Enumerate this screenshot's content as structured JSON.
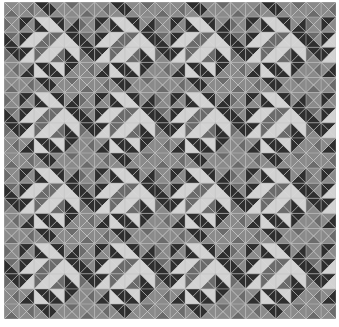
{
  "document": {
    "title": "Triangle Quilt Pattern",
    "width": 339,
    "height": 327,
    "background_color": "#ffffff"
  },
  "pattern": {
    "name": "half-square-triangle-quilt",
    "description": "Grid of square cells each split into four triangles by both diagonals, forming concentric diamond motifs",
    "origin_x": 4,
    "origin_y": 2,
    "cell_size": 15.1,
    "columns": 22,
    "rows": 21,
    "motif_period": 10,
    "seam_color": "#cfcfcf",
    "gridline_color": "#b9b9b9",
    "palette": {
      "dark": "#2e2e2e",
      "mid_dark": "#6b6b6b",
      "mid": "#8a8a8a",
      "light": "#d2d2d2"
    },
    "palette_keys": [
      "dark",
      "mid_dark",
      "mid",
      "light"
    ],
    "triangle_order": [
      "north",
      "east",
      "south",
      "west"
    ],
    "motif_tile": [
      [
        [
          2,
          2,
          1,
          2
        ],
        [
          2,
          1,
          2,
          2
        ],
        [
          0,
          0,
          2,
          2
        ],
        [
          2,
          2,
          2,
          0
        ],
        [
          1,
          2,
          2,
          2
        ],
        [
          2,
          2,
          1,
          2
        ],
        [
          2,
          1,
          2,
          2
        ],
        [
          0,
          0,
          2,
          2
        ],
        [
          2,
          2,
          2,
          0
        ],
        [
          1,
          2,
          2,
          2
        ]
      ],
      [
        [
          2,
          2,
          2,
          1
        ],
        [
          0,
          2,
          2,
          0
        ],
        [
          3,
          3,
          0,
          0
        ],
        [
          0,
          0,
          3,
          3
        ],
        [
          2,
          0,
          0,
          2
        ],
        [
          2,
          2,
          2,
          1
        ],
        [
          0,
          2,
          2,
          0
        ],
        [
          3,
          3,
          0,
          0
        ],
        [
          0,
          0,
          3,
          3
        ],
        [
          2,
          0,
          0,
          2
        ]
      ],
      [
        [
          1,
          2,
          0,
          0
        ],
        [
          0,
          3,
          3,
          0
        ],
        [
          3,
          1,
          1,
          3
        ],
        [
          1,
          3,
          3,
          1
        ],
        [
          0,
          0,
          3,
          3
        ],
        [
          1,
          2,
          0,
          0
        ],
        [
          0,
          3,
          3,
          0
        ],
        [
          3,
          1,
          1,
          3
        ],
        [
          1,
          3,
          3,
          1
        ],
        [
          0,
          0,
          3,
          3
        ]
      ],
      [
        [
          0,
          0,
          2,
          1
        ],
        [
          0,
          3,
          3,
          0
        ],
        [
          1,
          3,
          3,
          1
        ],
        [
          3,
          1,
          1,
          3
        ],
        [
          3,
          3,
          0,
          0
        ],
        [
          0,
          0,
          2,
          1
        ],
        [
          0,
          3,
          3,
          0
        ],
        [
          1,
          3,
          3,
          1
        ],
        [
          3,
          1,
          1,
          3
        ],
        [
          3,
          3,
          0,
          0
        ]
      ],
      [
        [
          2,
          1,
          2,
          2
        ],
        [
          2,
          0,
          0,
          2
        ],
        [
          0,
          0,
          3,
          3
        ],
        [
          3,
          3,
          0,
          0
        ],
        [
          0,
          2,
          2,
          0
        ],
        [
          2,
          1,
          2,
          2
        ],
        [
          2,
          0,
          0,
          2
        ],
        [
          0,
          0,
          3,
          3
        ],
        [
          3,
          3,
          0,
          0
        ],
        [
          0,
          2,
          2,
          0
        ]
      ],
      [
        [
          2,
          2,
          1,
          2
        ],
        [
          2,
          1,
          2,
          2
        ],
        [
          0,
          0,
          2,
          2
        ],
        [
          2,
          2,
          2,
          0
        ],
        [
          1,
          2,
          2,
          2
        ],
        [
          2,
          2,
          1,
          2
        ],
        [
          2,
          1,
          2,
          2
        ],
        [
          0,
          0,
          2,
          2
        ],
        [
          2,
          2,
          2,
          0
        ],
        [
          1,
          2,
          2,
          2
        ]
      ],
      [
        [
          2,
          2,
          2,
          1
        ],
        [
          0,
          2,
          2,
          0
        ],
        [
          3,
          3,
          0,
          0
        ],
        [
          0,
          0,
          3,
          3
        ],
        [
          2,
          0,
          0,
          2
        ],
        [
          2,
          2,
          2,
          1
        ],
        [
          0,
          2,
          2,
          0
        ],
        [
          3,
          3,
          0,
          0
        ],
        [
          0,
          0,
          3,
          3
        ],
        [
          2,
          0,
          0,
          2
        ]
      ],
      [
        [
          1,
          2,
          0,
          0
        ],
        [
          0,
          3,
          3,
          0
        ],
        [
          3,
          1,
          1,
          3
        ],
        [
          1,
          3,
          3,
          1
        ],
        [
          0,
          0,
          3,
          3
        ],
        [
          1,
          2,
          0,
          0
        ],
        [
          0,
          3,
          3,
          0
        ],
        [
          3,
          1,
          1,
          3
        ],
        [
          1,
          3,
          3,
          1
        ],
        [
          0,
          0,
          3,
          3
        ]
      ],
      [
        [
          0,
          0,
          2,
          1
        ],
        [
          0,
          3,
          3,
          0
        ],
        [
          1,
          3,
          3,
          1
        ],
        [
          3,
          1,
          1,
          3
        ],
        [
          3,
          3,
          0,
          0
        ],
        [
          0,
          0,
          2,
          1
        ],
        [
          0,
          3,
          3,
          0
        ],
        [
          1,
          3,
          3,
          1
        ],
        [
          3,
          1,
          1,
          3
        ],
        [
          3,
          3,
          0,
          0
        ]
      ],
      [
        [
          2,
          1,
          2,
          2
        ],
        [
          2,
          0,
          0,
          2
        ],
        [
          0,
          0,
          3,
          3
        ],
        [
          3,
          3,
          0,
          0
        ],
        [
          0,
          2,
          2,
          0
        ],
        [
          2,
          1,
          2,
          2
        ],
        [
          2,
          0,
          0,
          2
        ],
        [
          0,
          0,
          3,
          3
        ],
        [
          3,
          3,
          0,
          0
        ],
        [
          0,
          2,
          2,
          0
        ]
      ]
    ]
  }
}
